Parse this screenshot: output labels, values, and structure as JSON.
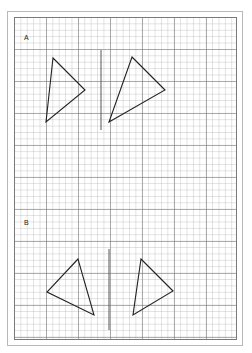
{
  "worksheet": {
    "sections": [
      {
        "label": "A",
        "label_pos": [
          24,
          34
        ],
        "mirror_line": {
          "x1": 101,
          "y1": 50,
          "x2": 101,
          "y2": 130
        },
        "triangles": [
          {
            "points": "53,58 85,90 46,122"
          },
          {
            "points": "132,57 165,90 109,122"
          }
        ]
      },
      {
        "label": "B",
        "label_pos": [
          24,
          219
        ],
        "mirror_line": {
          "x1": 109,
          "y1": 249,
          "x2": 109,
          "y2": 330
        },
        "triangles": [
          {
            "points": "78,259 47,292 94,315"
          },
          {
            "points": "141,259 173,291 133,315"
          }
        ]
      }
    ],
    "colors": {
      "line": "#222222",
      "mirror": "#555555"
    }
  }
}
